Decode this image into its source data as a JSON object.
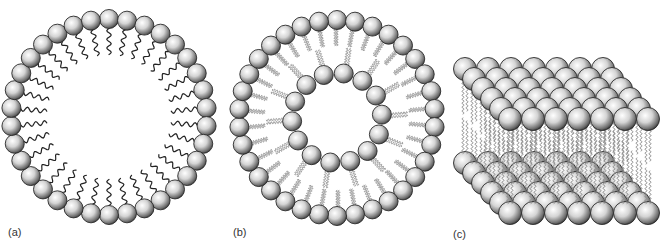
{
  "figure": {
    "panels": [
      {
        "id": "a",
        "label": "(a)",
        "structure": "micelle",
        "center": [
          109,
          117
        ],
        "head_ring_radius": 98,
        "head_radius": 9.5,
        "head_count": 34,
        "tail_length": 26,
        "label_pos": [
          8,
          226
        ]
      },
      {
        "id": "b",
        "label": "(b)",
        "structure": "vesicle",
        "center": [
          337,
          118
        ],
        "outer_ring_radius": 98,
        "inner_ring_radius": 45,
        "head_radius": 9.5,
        "outer_head_count": 34,
        "inner_head_count": 14,
        "label_pos": [
          233,
          226
        ]
      },
      {
        "id": "c",
        "label": "(c)",
        "structure": "bilayer",
        "columns": 7,
        "rows": 6,
        "top_layer_front_y": 119,
        "bottom_layer_front_y": 213,
        "front_left_x": 510,
        "col_spacing": 23,
        "row_dx": -9,
        "row_dy": -10,
        "head_radius": 11.5,
        "label_pos": [
          453,
          228
        ]
      }
    ],
    "colors": {
      "head_light": "#ffffff",
      "head_mid": "#c8c8c8",
      "head_dark": "#3a3a3a",
      "head_outline": "#2a2a2a",
      "tail_dark": "#222222",
      "tail_light": "#8a8a8a",
      "label": "#333333"
    }
  }
}
